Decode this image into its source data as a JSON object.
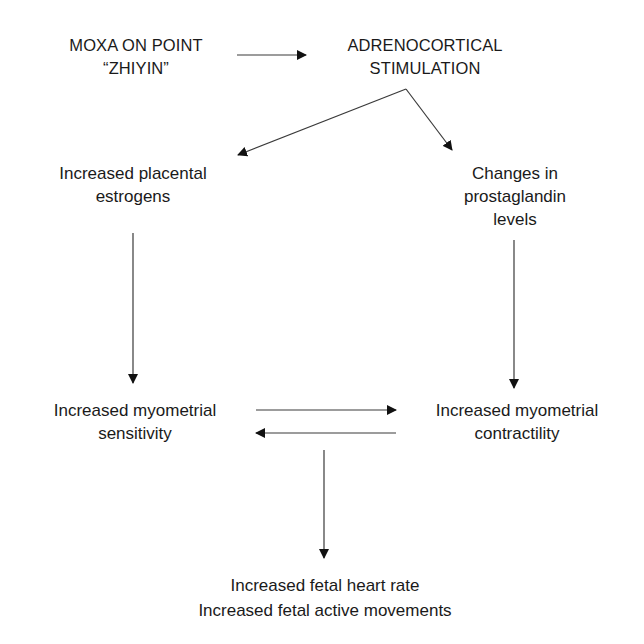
{
  "diagram": {
    "type": "flowchart",
    "nodes": {
      "moxa": {
        "line1": "MOXA ON POINT",
        "line2": "“ZHIYIN”"
      },
      "adreno": {
        "line1": "ADRENOCORTICAL",
        "line2": "STIMULATION"
      },
      "estrogens": {
        "line1": "Increased placental",
        "line2": "estrogens"
      },
      "prostaglandin": {
        "line1": "Changes in",
        "line2": "prostaglandin",
        "line3": "levels"
      },
      "sensitivity": {
        "line1": "Increased myometrial",
        "line2": "sensitivity"
      },
      "contractility": {
        "line1": "Increased myometrial",
        "line2": "contractility"
      },
      "fetal": {
        "line1": "Increased fetal heart rate",
        "line2": "Increased fetal active movements"
      }
    },
    "edges": [
      {
        "from": "moxa",
        "to": "adreno"
      },
      {
        "from": "adreno",
        "to": "estrogens"
      },
      {
        "from": "adreno",
        "to": "prostaglandin"
      },
      {
        "from": "estrogens",
        "to": "sensitivity"
      },
      {
        "from": "prostaglandin",
        "to": "contractility"
      },
      {
        "from": "sensitivity",
        "to": "contractility"
      },
      {
        "from": "contractility",
        "to": "sensitivity"
      },
      {
        "from": "sensitivity/contractility",
        "to": "fetal"
      }
    ],
    "colors": {
      "line": "#3a3a3a",
      "text": "#1a1a1a",
      "background": "#ffffff"
    }
  }
}
